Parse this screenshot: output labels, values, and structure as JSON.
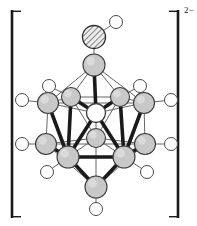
{
  "figure": {
    "kind": "chemical-structure-diagram",
    "charge_label": "2−",
    "bracket": {
      "left_x": 12,
      "right_x": 178,
      "top_y": 10,
      "bottom_y": 218,
      "tick_len": 9
    },
    "colors": {
      "stroke": "#1a1a1a",
      "thin_stroke": "#555555",
      "vertex_fill": "#c8c8c8",
      "vertex_stroke": "#3a3a3a",
      "hydrogen_fill": "#ffffff",
      "hydrogen_stroke": "#4a4a4a",
      "hatch_fill": "#e8e8e8",
      "hatch_stroke": "#2a2a2a",
      "background": "#ffffff"
    },
    "legend": {
      "gray_sphere": "cluster-vertex-atom",
      "open_circle": "terminal-hydrogen",
      "hatched_sphere": "substituent-heteroatom"
    }
  },
  "atoms": [
    {
      "id": "sub1",
      "kind": "hatched",
      "cx": 94,
      "cy": 37,
      "r": 11.5,
      "label": "substituent-atom"
    },
    {
      "id": "subH",
      "kind": "hydrogen",
      "cx": 116,
      "cy": 22,
      "r": 6.5,
      "label": "substituent-hydrogen"
    },
    {
      "id": "v1",
      "kind": "vertex",
      "cx": 94,
      "cy": 65,
      "r": 11.0,
      "label": "apex-top"
    },
    {
      "id": "v2",
      "kind": "vertex",
      "cx": 48,
      "cy": 103,
      "r": 10.5,
      "label": "upper-belt-left"
    },
    {
      "id": "v3",
      "kind": "vertex",
      "cx": 71,
      "cy": 97,
      "r": 9.5,
      "label": "upper-belt-left-inner"
    },
    {
      "id": "v4",
      "kind": "vertex",
      "cx": 120,
      "cy": 97,
      "r": 9.5,
      "label": "upper-belt-right-inner"
    },
    {
      "id": "v5",
      "kind": "vertex",
      "cx": 144,
      "cy": 103,
      "r": 10.5,
      "label": "upper-belt-right"
    },
    {
      "id": "v6",
      "kind": "open",
      "cx": 96,
      "cy": 113,
      "r": 9.5,
      "label": "upper-belt-front-open"
    },
    {
      "id": "v7",
      "kind": "vertex",
      "cx": 96,
      "cy": 138,
      "r": 9.5,
      "label": "lower-belt-back"
    },
    {
      "id": "v8",
      "kind": "vertex",
      "cx": 46,
      "cy": 144,
      "r": 10.5,
      "label": "lower-belt-left"
    },
    {
      "id": "v9",
      "kind": "vertex",
      "cx": 68,
      "cy": 157,
      "r": 11.0,
      "label": "lower-belt-left-front"
    },
    {
      "id": "v10",
      "kind": "vertex",
      "cx": 124,
      "cy": 157,
      "r": 11.0,
      "label": "lower-belt-right-front"
    },
    {
      "id": "v11",
      "kind": "vertex",
      "cx": 145,
      "cy": 144,
      "r": 10.5,
      "label": "lower-belt-right"
    },
    {
      "id": "v12",
      "kind": "vertex",
      "cx": 96,
      "cy": 187,
      "r": 11.0,
      "label": "apex-bottom"
    },
    {
      "id": "h2",
      "kind": "hydrogen",
      "cx": 22,
      "cy": 100,
      "r": 6.5,
      "label": "terminal-hydrogen"
    },
    {
      "id": "h3",
      "kind": "hydrogen",
      "cx": 49,
      "cy": 86,
      "r": 6.5,
      "label": "terminal-hydrogen"
    },
    {
      "id": "h4",
      "kind": "hydrogen",
      "cx": 140,
      "cy": 86,
      "r": 6.5,
      "label": "terminal-hydrogen"
    },
    {
      "id": "h5",
      "kind": "hydrogen",
      "cx": 171,
      "cy": 100,
      "r": 6.5,
      "label": "terminal-hydrogen"
    },
    {
      "id": "h8",
      "kind": "hydrogen",
      "cx": 22,
      "cy": 144,
      "r": 6.5,
      "label": "terminal-hydrogen"
    },
    {
      "id": "h9",
      "kind": "hydrogen",
      "cx": 47,
      "cy": 172,
      "r": 6.5,
      "label": "terminal-hydrogen"
    },
    {
      "id": "h10",
      "kind": "hydrogen",
      "cx": 147,
      "cy": 172,
      "r": 6.5,
      "label": "terminal-hydrogen"
    },
    {
      "id": "h11",
      "kind": "hydrogen",
      "cx": 171,
      "cy": 144,
      "r": 6.5,
      "label": "terminal-hydrogen"
    },
    {
      "id": "h12",
      "kind": "hydrogen",
      "cx": 96,
      "cy": 209,
      "r": 6.5,
      "label": "terminal-hydrogen"
    }
  ],
  "bonds_thin": [
    [
      "v1",
      "v2"
    ],
    [
      "v1",
      "v3"
    ],
    [
      "v1",
      "v4"
    ],
    [
      "v1",
      "v5"
    ],
    [
      "v2",
      "v3"
    ],
    [
      "v3",
      "v4"
    ],
    [
      "v4",
      "v5"
    ],
    [
      "v2",
      "v5"
    ],
    [
      "v2",
      "v8"
    ],
    [
      "v5",
      "v11"
    ],
    [
      "v3",
      "v7"
    ],
    [
      "v4",
      "v7"
    ],
    [
      "v3",
      "v9"
    ],
    [
      "v4",
      "v10"
    ],
    [
      "v2",
      "v9"
    ],
    [
      "v5",
      "v10"
    ],
    [
      "v7",
      "v8"
    ],
    [
      "v7",
      "v11"
    ],
    [
      "v7",
      "v9"
    ],
    [
      "v7",
      "v10"
    ],
    [
      "v8",
      "v9"
    ],
    [
      "v10",
      "v11"
    ],
    [
      "v8",
      "v11"
    ],
    [
      "v8",
      "v12"
    ],
    [
      "v11",
      "v12"
    ],
    [
      "v7",
      "v12"
    ],
    [
      "v6",
      "v2"
    ],
    [
      "v6",
      "v5"
    ],
    [
      "v6",
      "v7"
    ]
  ],
  "bonds_bold": [
    [
      "v1",
      "v6"
    ],
    [
      "v6",
      "v3"
    ],
    [
      "v6",
      "v4"
    ],
    [
      "v6",
      "v9"
    ],
    [
      "v6",
      "v10"
    ],
    [
      "v2",
      "v9"
    ],
    [
      "v5",
      "v10"
    ],
    [
      "v3",
      "v9"
    ],
    [
      "v4",
      "v10"
    ],
    [
      "v9",
      "v10"
    ],
    [
      "v9",
      "v12"
    ],
    [
      "v10",
      "v12"
    ],
    [
      "v8",
      "v9"
    ],
    [
      "v10",
      "v11"
    ]
  ],
  "bonds_terminal": [
    [
      "sub1",
      "subH"
    ],
    [
      "sub1",
      "v1"
    ],
    [
      "v2",
      "h2"
    ],
    [
      "v3",
      "h3"
    ],
    [
      "v4",
      "h4"
    ],
    [
      "v5",
      "h5"
    ],
    [
      "v8",
      "h8"
    ],
    [
      "v9",
      "h9"
    ],
    [
      "v10",
      "h10"
    ],
    [
      "v11",
      "h11"
    ],
    [
      "v12",
      "h12"
    ]
  ]
}
